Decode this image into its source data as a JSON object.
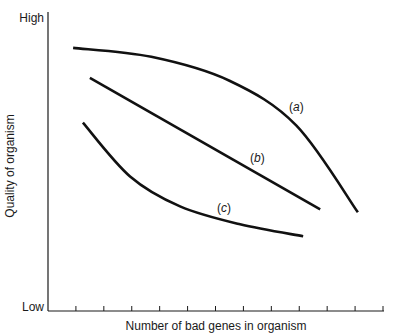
{
  "chart_data": {
    "type": "line",
    "title": "",
    "xlabel": "Number of bad genes in organism",
    "ylabel": "Quality of organism",
    "y_tick_labels": {
      "top": "High",
      "bottom": "Low"
    },
    "xlim": [
      0,
      12
    ],
    "ylim": [
      0,
      1
    ],
    "x_tick_count": 12,
    "grid": false,
    "legend": "none (inline curve labels)",
    "series": [
      {
        "name": "(a)",
        "label": "(a)",
        "x": [
          0.9,
          3.7,
          6.5,
          8.9,
          11.1
        ],
        "y": [
          0.88,
          0.85,
          0.77,
          0.62,
          0.33
        ],
        "label_at": [
          8.9,
          0.67
        ]
      },
      {
        "name": "(b)",
        "label": "(b)",
        "x": [
          1.5,
          9.75
        ],
        "y": [
          0.78,
          0.34
        ],
        "label_at": [
          7.5,
          0.5
        ]
      },
      {
        "name": "(c)",
        "label": "(c)",
        "x": [
          1.25,
          2.94,
          4.73,
          6.88,
          9.14
        ],
        "y": [
          0.63,
          0.45,
          0.35,
          0.29,
          0.25
        ],
        "label_at": [
          6.3,
          0.33
        ]
      }
    ]
  }
}
